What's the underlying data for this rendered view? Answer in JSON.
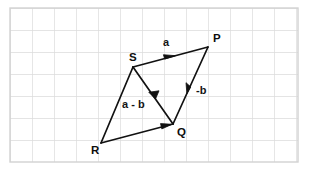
{
  "figure": {
    "background_color": "#ffffff",
    "grid": {
      "line_color": "#d9d9d9",
      "cell_size_px": 22,
      "left_px": 10,
      "top_px": 8,
      "right_px": 298,
      "bottom_px": 162,
      "columns": 13,
      "rows": 7,
      "border_color": "#cfcfcf"
    },
    "stroke_color": "#111111",
    "stroke_width": 1.6,
    "vertices": [
      {
        "name": "P",
        "label": "P",
        "x": 208,
        "y": 47,
        "label_x": 213,
        "label_y": 42
      },
      {
        "name": "Q",
        "label": "Q",
        "x": 173,
        "y": 124,
        "label_x": 177,
        "label_y": 136
      },
      {
        "name": "R",
        "label": "R",
        "x": 101,
        "y": 143,
        "label_x": 91,
        "label_y": 154
      },
      {
        "name": "S",
        "label": "S",
        "x": 133,
        "y": 67,
        "label_x": 129,
        "label_y": 61
      }
    ],
    "segments": [
      {
        "name": "SP",
        "from": "S",
        "to": "P",
        "arrow": "mid-forward",
        "vector_label": "a"
      },
      {
        "name": "PQ",
        "from": "P",
        "to": "Q",
        "arrow": "mid-forward",
        "vector_label": "-b"
      },
      {
        "name": "SQ",
        "from": "S",
        "to": "Q",
        "arrow": "mid-forward",
        "vector_label": ""
      },
      {
        "name": "RQ",
        "from": "R",
        "to": "Q",
        "arrow": "mid-forward",
        "vector_label": ""
      },
      {
        "name": "RS",
        "from": "R",
        "to": "S",
        "arrow": "none",
        "vector_label": "a - b"
      }
    ],
    "vector_labels": [
      {
        "name": "vector-a",
        "text": "a",
        "x": 163,
        "y": 46
      },
      {
        "name": "vector-minus-b",
        "text": "-b",
        "x": 196,
        "y": 94
      },
      {
        "name": "vector-a-minus-b",
        "text": "a - b",
        "x": 122,
        "y": 108
      }
    ]
  }
}
